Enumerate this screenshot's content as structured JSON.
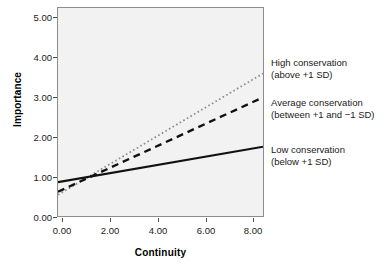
{
  "chart_data": {
    "type": "line",
    "title": "",
    "xlabel": "Continuity",
    "ylabel": "Importance",
    "xlim": [
      -0.5,
      8.5
    ],
    "ylim": [
      -0.2,
      5.2
    ],
    "xticks": [
      "0.00",
      "2.00",
      "4.00",
      "6.00",
      "8.00"
    ],
    "xtick_values": [
      0,
      2,
      4,
      6,
      8
    ],
    "yticks": [
      "0.00",
      "1.00",
      "2.00",
      "3.00",
      "4.00",
      "5.00"
    ],
    "ytick_values": [
      0,
      1,
      2,
      3,
      4,
      5
    ],
    "grid": false,
    "legend_position": "right-outside",
    "background": "#f2f2f2",
    "x": [
      -0.5,
      8.5
    ],
    "series": [
      {
        "name": "High conservation",
        "style": "dotted",
        "color": "#8c8c8c",
        "values": [
          0.35,
          3.5
        ]
      },
      {
        "name": "Average conservation",
        "style": "dashed",
        "color": "#111111",
        "values": [
          0.43,
          2.88
        ]
      },
      {
        "name": "Low conservation",
        "style": "solid",
        "color": "#111111",
        "values": [
          0.68,
          1.6
        ]
      }
    ],
    "annotations": [
      {
        "line1": "High conservation",
        "line2": "(above +1 SD)"
      },
      {
        "line1": "Average conservation",
        "line2": "(between +1 and −1 SD)"
      },
      {
        "line1": "Low conservation",
        "line2": "(below +1 SD)"
      }
    ]
  },
  "axes": {
    "x_title": "Continuity",
    "y_title": "Importance",
    "x_ticks": [
      "0.00",
      "2.00",
      "4.00",
      "6.00",
      "8.00"
    ],
    "y_ticks": [
      "5.00",
      "4.00",
      "3.00",
      "2.00",
      "1.00",
      "0.00"
    ]
  },
  "legend": {
    "high": {
      "line1": "High conservation",
      "line2": "(above +1 SD)"
    },
    "average": {
      "line1": "Average conservation",
      "line2": "(between +1 and −1 SD)"
    },
    "low": {
      "line1": "Low conservation",
      "line2": "(below +1 SD)"
    }
  }
}
